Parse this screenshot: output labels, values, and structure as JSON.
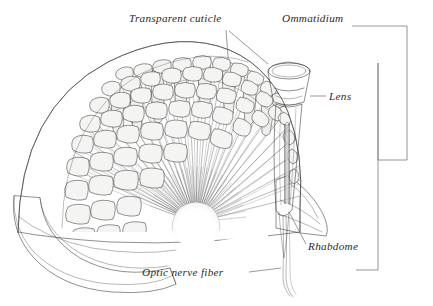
{
  "figure": {
    "background_color": "#ffffff",
    "ink_color": "#333333",
    "label_color": "#2b2b2b",
    "leader_color": "#6d6d6d"
  },
  "labels": {
    "transparent_cuticle": "Transparent cuticle",
    "ommatidium": "Ommatidium",
    "lens": "Lens",
    "rhabdome": "Rhabdome",
    "optic_nerve_fiber": "Optic nerve fiber"
  },
  "brackets": {
    "outer_label": "Ommatidium",
    "outer_span": "whole ommatidium",
    "inner_span": "eye depth"
  },
  "structures": {
    "dome": "hexagonal facet dome",
    "cutaway": "radiating ommatidia cutaway",
    "hub": "optic nerve convergence",
    "base_rim": "basal flange",
    "single_ommatidium": "enlarged ommatidium"
  }
}
